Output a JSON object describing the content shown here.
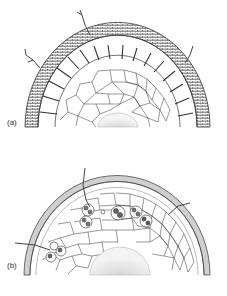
{
  "figure": {
    "panels": [
      {
        "id": "a",
        "label": "(a)",
        "description": "Half cross-section of root with thick brick-patterned outer sheath, radial partition cells, polygonal cortex cells and stippled central core; branched hyphae extending outward"
      },
      {
        "id": "b",
        "label": "(b)",
        "description": "Half cross-section of root with thin outer layer, polygonal cortex cells containing coiled hyphal clusters, hyphae penetrating from outside, stippled central core"
      }
    ]
  },
  "colors": {
    "line": "#333333",
    "stipple": "#bbbbbb",
    "background": "#ffffff",
    "outer_layer_b": "#cfcfcf"
  }
}
